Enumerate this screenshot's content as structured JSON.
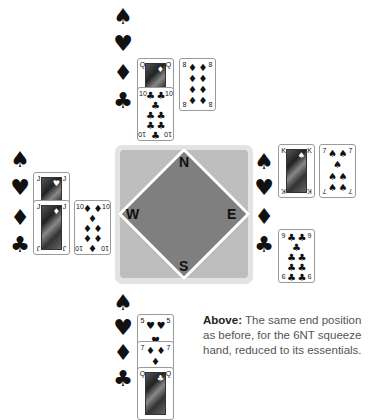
{
  "compass": {
    "north": "N",
    "east": "E",
    "south": "S",
    "west": "W",
    "colors": {
      "outer": "#e3e3e3",
      "inner": "#bdbdbd",
      "diamond": "#7f7f7f"
    }
  },
  "suit_symbols": {
    "spades": "♠",
    "hearts": "♥",
    "diamonds": "♦",
    "clubs": "♣"
  },
  "hands": {
    "north": {
      "spades": [],
      "hearts": [],
      "diamonds": [
        "Q",
        "8"
      ],
      "clubs": [
        "10"
      ]
    },
    "west": {
      "spades": [],
      "hearts": [
        "J"
      ],
      "diamonds": [
        "J",
        "10"
      ],
      "clubs": []
    },
    "east": {
      "spades": [
        "K",
        "7"
      ],
      "hearts": [],
      "diamonds": [],
      "clubs": [
        "9"
      ]
    },
    "south": {
      "spades": [],
      "hearts": [
        "5"
      ],
      "diamonds": [
        "7"
      ],
      "clubs": [
        "Q"
      ]
    }
  },
  "cards": {
    "north_qd": {
      "rank": "Q",
      "suit": "♦"
    },
    "north_8d": {
      "rank": "8",
      "suit": "♦"
    },
    "north_10c": {
      "rank": "10",
      "suit": "♣"
    },
    "west_jh": {
      "rank": "J",
      "suit": "♥"
    },
    "west_jd": {
      "rank": "J",
      "suit": "♦"
    },
    "west_10d": {
      "rank": "10",
      "suit": "♦"
    },
    "east_ks": {
      "rank": "K",
      "suit": "♠"
    },
    "east_7s": {
      "rank": "7",
      "suit": "♠"
    },
    "east_9c": {
      "rank": "9",
      "suit": "♣"
    },
    "south_5h": {
      "rank": "5",
      "suit": "♥"
    },
    "south_7d": {
      "rank": "7",
      "suit": "♦"
    },
    "south_qc": {
      "rank": "Q",
      "suit": "♣"
    }
  },
  "caption": {
    "lead": "Above:",
    "text": " The same end position as before, for the 6NT squeeze hand, reduced to its essentials."
  }
}
